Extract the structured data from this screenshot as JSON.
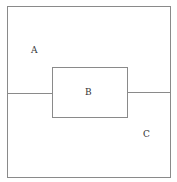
{
  "diagram": {
    "regions": [
      {
        "id": "A",
        "label": "A"
      },
      {
        "id": "B",
        "label": "B"
      },
      {
        "id": "C",
        "label": "C"
      }
    ],
    "line_color": "#8a8a8a"
  }
}
